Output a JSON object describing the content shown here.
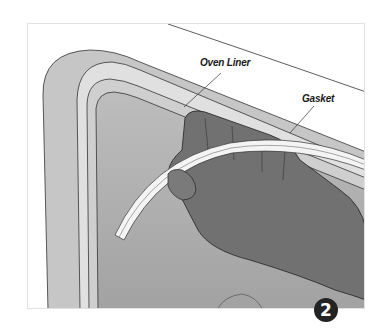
{
  "figure": {
    "step_number": "2",
    "labels": {
      "oven_liner": "Oven Liner",
      "gasket": "Gasket"
    },
    "colors": {
      "door_frame": "#c4c4c4",
      "liner_band": "#dedede",
      "interior": "#a9a9a9",
      "hand": "#6f6f6f",
      "gasket": "#f2f2f2",
      "badge": "#232323"
    }
  }
}
